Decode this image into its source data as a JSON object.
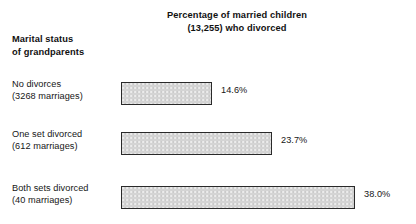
{
  "chart_data": {
    "type": "bar",
    "orientation": "horizontal",
    "title": "Percentage of married children (13,255) who divorced",
    "title_lines": [
      "Percentage of married children",
      "(13,255) who divorced"
    ],
    "ylabel": "Marital status of grandparents",
    "ylabel_lines": [
      "Marital status",
      "of grandparents"
    ],
    "xlabel": "",
    "categories": [
      "No divorces (3268 marriages)",
      "One set divorced (612 marriages)",
      "Both sets divorced (40 marriages)"
    ],
    "category_lines": [
      [
        "No divorces",
        "(3268 marriages)"
      ],
      [
        "One set divorced",
        "(612 marriages)"
      ],
      [
        "Both sets divorced",
        "(40 marriages)"
      ]
    ],
    "values": [
      14.6,
      23.7,
      38.0
    ],
    "value_labels": [
      "14.6%",
      "23.7%",
      "38.0%"
    ],
    "xlim": [
      0,
      38.0
    ],
    "grid": false,
    "legend": "none",
    "bar_color": "#d4d4d4",
    "bar_border_color": "#2a2a2a",
    "text_color": "#161616",
    "background_color": "#ffffff"
  },
  "rows": [
    {
      "label_line1": "No divorces",
      "label_line2": "(3268 marriages)",
      "value_label": "14.6%",
      "bar_width_px": 91,
      "top_px": 78
    },
    {
      "label_line1": "One set divorced",
      "label_line2": "(612 marriages)",
      "value_label": "23.7%",
      "bar_width_px": 151,
      "top_px": 128
    },
    {
      "label_line1": "Both sets divorced",
      "label_line2": "(40 marriages)",
      "value_label": "38.0%",
      "bar_width_px": 234,
      "top_px": 182
    }
  ],
  "title": {
    "line1": "Percentage of married children",
    "line2": "(13,255) who divorced"
  },
  "axis_title": {
    "line1": "Marital status",
    "line2": "of grandparents"
  }
}
